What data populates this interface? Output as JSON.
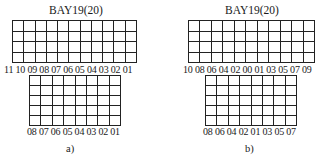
{
  "panels": [
    {
      "title": "BAY19(20)",
      "upper": {
        "rows": 4,
        "cols": 11,
        "labels": "11 10 09 08 07 06 05 04 03 02 01"
      },
      "lower": {
        "rows": 5,
        "cols": 8,
        "labels": "08 07 06 05 04 03 02 01"
      },
      "caption": "a)"
    },
    {
      "title": "BAY19(20)",
      "upper": {
        "rows": 4,
        "cols": 11,
        "labels": "10 08 06 04 02 00 01 03 05 07 09"
      },
      "lower": {
        "rows": 5,
        "cols": 8,
        "labels": "08 06 04 02 01 03 05 07"
      },
      "caption": "b)"
    }
  ],
  "colors": {
    "grid_line": "#222222",
    "background": "#ffffff"
  }
}
